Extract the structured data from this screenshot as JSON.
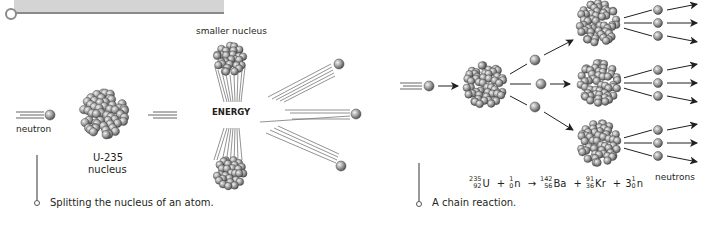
{
  "header_bar": {
    "color": "#d4d4d4",
    "line_color": "#8a8a8a"
  },
  "left_panel": {
    "labels": {
      "smaller_nucleus": "smaller nucleus",
      "neutron": "neutron",
      "u235_line1": "U-235",
      "u235_line2": "nucleus",
      "energy": "ENERGY"
    },
    "caption": "Splitting the nucleus of an atom."
  },
  "right_panel": {
    "labels": {
      "neutrons": "neutrons"
    },
    "caption": "A chain reaction.",
    "equation": {
      "terms": [
        {
          "mass": "235",
          "atomic": "92",
          "symbol": "U"
        },
        {
          "op": "+"
        },
        {
          "mass": "1",
          "atomic": "0",
          "symbol": "n"
        },
        {
          "op": "→"
        },
        {
          "mass": "142",
          "atomic": "56",
          "symbol": "Ba"
        },
        {
          "op": "+"
        },
        {
          "mass": "91",
          "atomic": "36",
          "symbol": "Kr"
        },
        {
          "op": "+"
        },
        {
          "coef": "3",
          "mass": "1",
          "atomic": "0",
          "symbol": "n"
        }
      ]
    }
  },
  "colors": {
    "sphere_light": "#e6e6e6",
    "sphere_dark": "#6e6e6e",
    "text": "#231f20",
    "lines": "#555555"
  }
}
